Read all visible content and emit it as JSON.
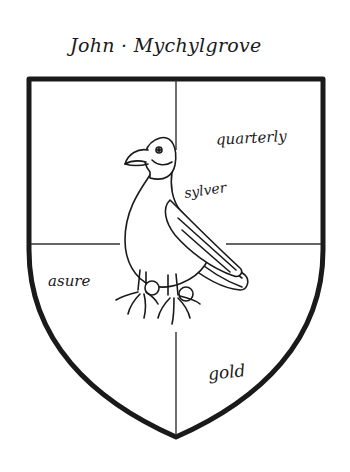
{
  "figure": {
    "owner_name": "John · Mychylgrove",
    "blazon": {
      "division": "quarterly",
      "tinctures": {
        "upper_right_label": "quarterly",
        "bird_label": "sylver",
        "lower_left_label": "asure",
        "lower_right_label": "gold"
      }
    },
    "charge": "bird-perched",
    "colors": {
      "ink": "#1a1a1a",
      "background": "#ffffff"
    }
  }
}
